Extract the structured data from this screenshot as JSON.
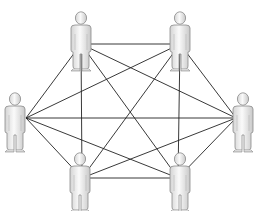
{
  "diagram": {
    "caption_fragment": "",
    "line_color": "#222222",
    "figure_fill": "#e8e8e8",
    "figure_stroke": "#8a8a8a",
    "nodes": [
      {
        "id": "top-left",
        "x": 81,
        "y": 12,
        "anchor": [
          81,
          44
        ]
      },
      {
        "id": "top-right",
        "x": 180,
        "y": 12,
        "anchor": [
          180,
          44
        ]
      },
      {
        "id": "left",
        "x": 15,
        "y": 93,
        "anchor": [
          26,
          118
        ]
      },
      {
        "id": "right",
        "x": 243,
        "y": 93,
        "anchor": [
          236,
          118
        ]
      },
      {
        "id": "bottom-left",
        "x": 80,
        "y": 153,
        "anchor": [
          82,
          178
        ]
      },
      {
        "id": "bottom-right",
        "x": 180,
        "y": 153,
        "anchor": [
          178,
          178
        ]
      }
    ],
    "edges": [
      [
        "top-left",
        "top-right"
      ],
      [
        "top-left",
        "left"
      ],
      [
        "top-left",
        "right"
      ],
      [
        "top-left",
        "bottom-left"
      ],
      [
        "top-left",
        "bottom-right"
      ],
      [
        "top-right",
        "left"
      ],
      [
        "top-right",
        "right"
      ],
      [
        "top-right",
        "bottom-left"
      ],
      [
        "top-right",
        "bottom-right"
      ],
      [
        "left",
        "right"
      ],
      [
        "left",
        "bottom-left"
      ],
      [
        "left",
        "bottom-right"
      ],
      [
        "right",
        "bottom-left"
      ],
      [
        "right",
        "bottom-right"
      ],
      [
        "bottom-left",
        "bottom-right"
      ]
    ]
  }
}
